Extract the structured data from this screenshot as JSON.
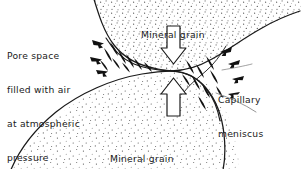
{
  "figure": {
    "kind": "geotechnical-diagram",
    "title_on_image": "",
    "background_color": "#ffffff",
    "ink_color": "#1a1a1a",
    "stipple_color": "#4a4a4a",
    "width": 301,
    "height": 169
  },
  "labels": {
    "top_grain": "Mineral grain",
    "bottom_grain": "Mineral grain",
    "pore_space": {
      "line1": "Pore space",
      "line2": "filled with air",
      "line3": "at atmospheric",
      "line4": "pressure"
    },
    "capillary": {
      "line1": "Capillary",
      "line2": "meniscus"
    }
  },
  "annotations": {
    "compression_arrow_top": "hollow-arrow-down-icon",
    "compression_arrow_bottom": "hollow-arrow-up-icon",
    "surface_tension_arrows": "filled-arrow-icon",
    "surface_tension_arrow_count": 22,
    "leader_line_capillary": "leader-line",
    "grain_boundary_upper": "grain-boundary-curve",
    "grain_boundary_lower": "grain-boundary-curve",
    "meniscus_left": "meniscus-curve",
    "meniscus_right": "meniscus-curve"
  }
}
